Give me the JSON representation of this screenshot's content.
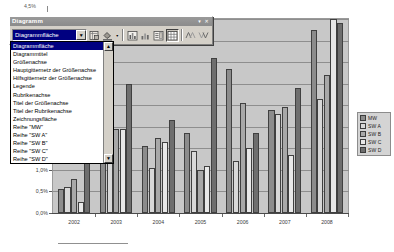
{
  "window": {
    "title": "Diagramm",
    "minimize_label": "▾",
    "close_label": "✕"
  },
  "toolbar": {
    "combo": {
      "value": "Diagrammfläche",
      "arrow": "▼"
    },
    "buttons": [
      {
        "name": "format-object-button",
        "label": "▤"
      },
      {
        "name": "fill-color-button",
        "label": "▰"
      },
      {
        "name": "fill-color-dropdown-arrow",
        "label": "▾"
      },
      {
        "name": "chart-type-button",
        "label": "▥"
      },
      {
        "name": "chart-type-dropdown-arrow",
        "label": "▪"
      },
      {
        "name": "legend-toggle-button",
        "label": "▤"
      },
      {
        "name": "data-table-button",
        "label": "▦"
      },
      {
        "name": "by-row-button",
        "label": "≪"
      },
      {
        "name": "by-column-button",
        "label": "≫"
      }
    ]
  },
  "dropdown": {
    "scroll_up": "▲",
    "scroll_down": "▼",
    "selected_index": 0,
    "items": [
      "Diagrammfläche",
      "Diagrammtitel",
      "Größenachse",
      "Hauptgitternetz der Größenachse",
      "Hilfsgitternetz der Größenachse",
      "Legende",
      "Rubrikenachse",
      "Titel der Größenachse",
      "Titel der Rubrikenachse",
      "Zeichnungsfläche",
      "Reihe \"MW\"",
      "Reihe \"SW A\"",
      "Reihe \"SW B\"",
      "Reihe \"SW C\"",
      "Reihe \"SW D\""
    ]
  },
  "chart_data": {
    "type": "bar",
    "title": "",
    "xlabel": "",
    "ylabel": "",
    "categories": [
      "2002",
      "2003",
      "2004",
      "2005",
      "2006",
      "2007",
      "2008"
    ],
    "ytick_labels": [
      "0,0%",
      "0,5%",
      "1,0%",
      "1,5%",
      "2,0%",
      "2,5%",
      "3,0%",
      "3,5%",
      "4,0%",
      "4,5%"
    ],
    "ylim": [
      0.0,
      4.5
    ],
    "top_axis_label": "4,5%",
    "grid": true,
    "legend_position": "right",
    "series": [
      {
        "name": "MW",
        "color": "#8c8c8c",
        "values": [
          0.55,
          1.35,
          1.55,
          1.85,
          3.35,
          2.4,
          4.25
        ]
      },
      {
        "name": "SW A",
        "color": "#d8d8d8",
        "values": [
          0.6,
          1.3,
          1.05,
          1.45,
          1.2,
          2.3,
          2.65
        ]
      },
      {
        "name": "SW B",
        "color": "#a8a8a8",
        "values": [
          0.8,
          1.95,
          1.75,
          1.0,
          2.55,
          2.45,
          3.2
        ]
      },
      {
        "name": "SW C",
        "color": "#e8e8e8",
        "values": [
          0.25,
          1.95,
          1.65,
          1.1,
          1.5,
          1.35,
          4.5
        ]
      },
      {
        "name": "SW D",
        "color": "#6e6e6e",
        "values": [
          2.25,
          3.0,
          2.15,
          3.6,
          1.85,
          2.9,
          4.4
        ]
      }
    ]
  }
}
